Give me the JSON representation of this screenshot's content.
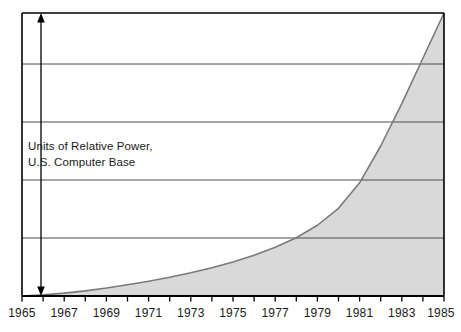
{
  "chart_data": {
    "type": "area",
    "title": "",
    "subtitle": "",
    "annotation_lines": [
      "Units of Relative Power,",
      "U.S. Computer Base"
    ],
    "xlabel": "",
    "ylabel": "Units of Relative Power, U.S. Computer Base",
    "xlim": [
      1965,
      1985
    ],
    "ylim": [
      0,
      5
    ],
    "grid": "horizontal",
    "legend": "none",
    "y_gridline_values": [
      1,
      2,
      3,
      4
    ],
    "y_axis_style": "double-headed-arrow, unlabeled",
    "x_tick_values": [
      1965,
      1966,
      1967,
      1968,
      1969,
      1970,
      1971,
      1972,
      1973,
      1974,
      1975,
      1976,
      1977,
      1978,
      1979,
      1980,
      1981,
      1982,
      1983,
      1984,
      1985
    ],
    "x_tick_labels": [
      "1965",
      "",
      "1967",
      "",
      "1969",
      "",
      "1971",
      "",
      "1973",
      "",
      "1975",
      "",
      "1977",
      "",
      "1979",
      "",
      "1981",
      "",
      "1983",
      "",
      "1985"
    ],
    "x": [
      1965,
      1966,
      1967,
      1968,
      1969,
      1970,
      1971,
      1972,
      1973,
      1974,
      1975,
      1976,
      1977,
      1978,
      1979,
      1980,
      1981,
      1982,
      1983,
      1984,
      1985
    ],
    "series": [
      {
        "name": "Units of Relative Power",
        "values": [
          0.0,
          0.02,
          0.05,
          0.09,
          0.14,
          0.2,
          0.26,
          0.33,
          0.41,
          0.5,
          0.6,
          0.72,
          0.86,
          1.03,
          1.25,
          1.55,
          2.0,
          2.65,
          3.4,
          4.2,
          5.0
        ]
      }
    ],
    "colors": {
      "area_fill": "#d9d9d9",
      "curve_line": "#7a7a7a",
      "axis": "#000000",
      "gridline": "#555555",
      "text": "#1a1a1a",
      "background": "#ffffff"
    }
  }
}
